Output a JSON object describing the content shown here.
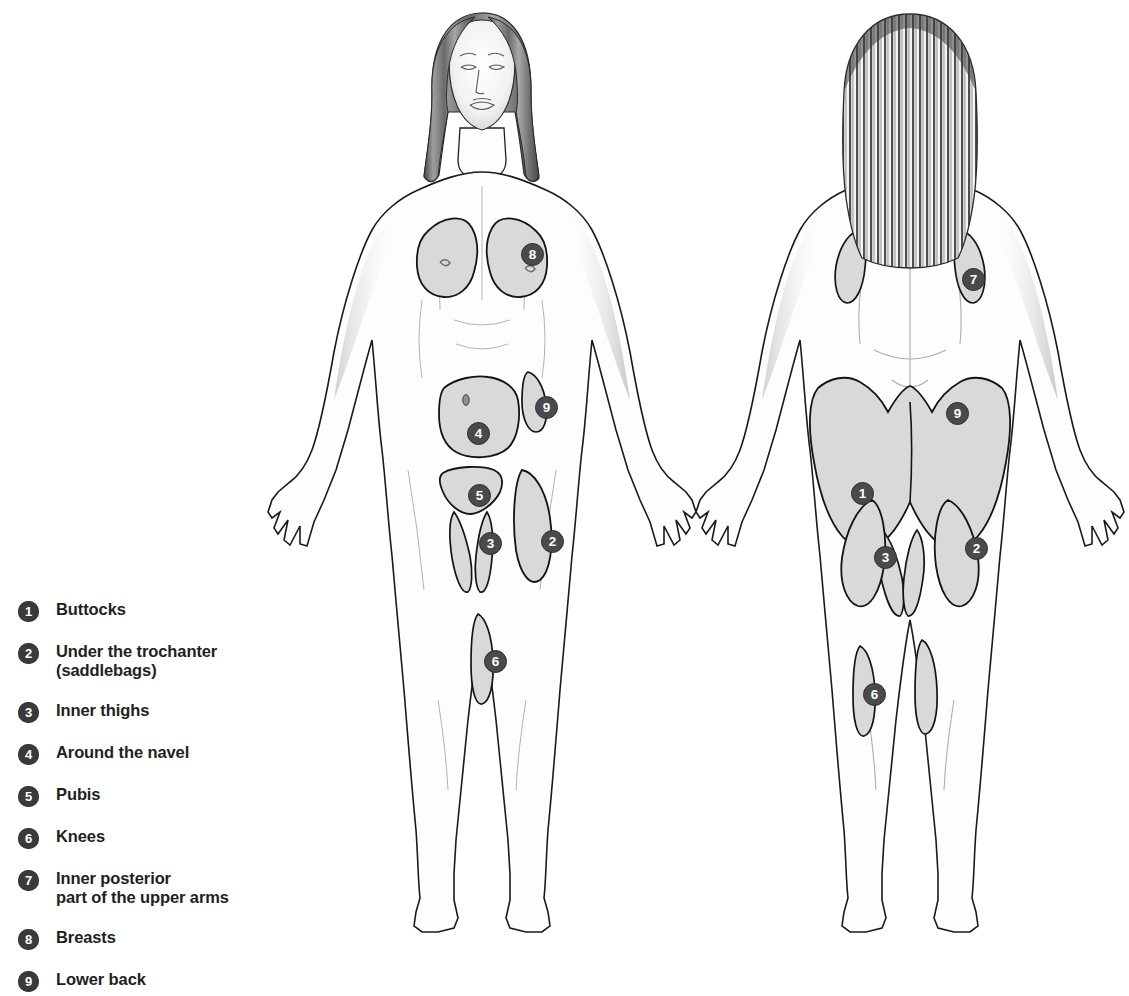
{
  "diagram": {
    "background_color": "#ffffff",
    "zone_fill_color": "#d9d9d9",
    "outline_color": "#1a1a1a",
    "badge_color": "#3a3a3a",
    "badge_text_color": "#ffffff"
  },
  "legend": {
    "items": [
      {
        "number": "1",
        "label": "Buttocks"
      },
      {
        "number": "2",
        "label": "Under the trochanter\n(saddlebags)"
      },
      {
        "number": "3",
        "label": "Inner thighs"
      },
      {
        "number": "4",
        "label": "Around the navel"
      },
      {
        "number": "5",
        "label": "Pubis"
      },
      {
        "number": "6",
        "label": "Knees"
      },
      {
        "number": "7",
        "label": "Inner posterior\npart of the upper arms"
      },
      {
        "number": "8",
        "label": "Breasts"
      },
      {
        "number": "9",
        "label": "Lower back"
      }
    ]
  },
  "views": [
    {
      "name": "front",
      "orientation": "anterior",
      "markers": [
        {
          "number": "8",
          "zone": "breast",
          "x": 289,
          "y": 243
        },
        {
          "number": "9",
          "zone": "lower-back",
          "x": 303,
          "y": 396
        },
        {
          "number": "4",
          "zone": "around-navel",
          "x": 235,
          "y": 422
        },
        {
          "number": "5",
          "zone": "pubis",
          "x": 236,
          "y": 484
        },
        {
          "number": "3",
          "zone": "inner-thighs",
          "x": 247,
          "y": 532
        },
        {
          "number": "2",
          "zone": "saddlebags",
          "x": 309,
          "y": 530
        },
        {
          "number": "6",
          "zone": "knees",
          "x": 252,
          "y": 650
        }
      ]
    },
    {
      "name": "back",
      "orientation": "posterior",
      "markers": [
        {
          "number": "7",
          "zone": "inner-posterior-upper-arms",
          "x": 302,
          "y": 268
        },
        {
          "number": "9",
          "zone": "lower-back",
          "x": 286,
          "y": 402
        },
        {
          "number": "1",
          "zone": "buttocks",
          "x": 191,
          "y": 482
        },
        {
          "number": "2",
          "zone": "saddlebags",
          "x": 305,
          "y": 537
        },
        {
          "number": "3",
          "zone": "inner-thighs",
          "x": 214,
          "y": 546
        },
        {
          "number": "6",
          "zone": "knees",
          "x": 203,
          "y": 683
        }
      ]
    }
  ]
}
